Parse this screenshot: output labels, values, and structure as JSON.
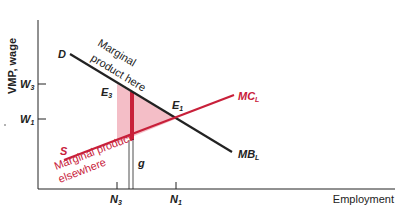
{
  "axes": {
    "y_label": "VMP, wage",
    "x_label": "Employment",
    "y_ticks": [
      {
        "label": "W",
        "sub": "3"
      },
      {
        "label": "W",
        "sub": "1"
      }
    ],
    "x_ticks": [
      {
        "label": "N",
        "sub": "3"
      },
      {
        "label": "N",
        "sub": "1"
      }
    ]
  },
  "curves": {
    "demand": {
      "label": "D",
      "end_label": "MB",
      "end_sub": "L",
      "annotation_1": "Marginal",
      "annotation_2": "product here"
    },
    "supply": {
      "label": "S",
      "end_label": "MC",
      "end_sub": "L",
      "annotation_1": "Marginal product",
      "annotation_2": "elsewhere"
    }
  },
  "points": {
    "e3": {
      "label": "E",
      "sub": "3"
    },
    "e1": {
      "label": "E",
      "sub": "1"
    },
    "gap": "g"
  },
  "colors": {
    "black": "#222222",
    "red": "#c8203a",
    "shade": "#f2b3bd"
  }
}
